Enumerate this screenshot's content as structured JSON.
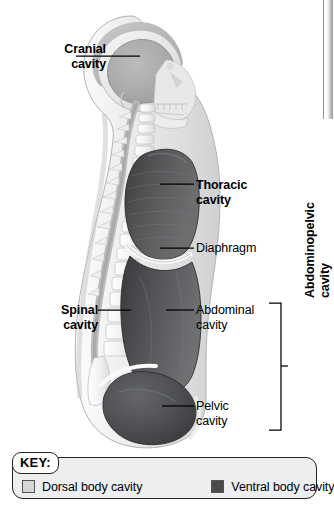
{
  "figure": {
    "labels": {
      "cranial": "Cranial\ncavity",
      "thoracic": "Thoracic\ncavity",
      "diaphragm": "Diaphragm",
      "abdominal": "Abdominal\ncavity",
      "spinal": "Spinal\ncavity",
      "pelvic": "Pelvic\ncavity",
      "abdominopelvic": "Abdominopelvic\ncavity"
    }
  },
  "key": {
    "title": "KEY:",
    "items": [
      {
        "label": "Dorsal body cavity",
        "color": "#d3d5d6"
      },
      {
        "label": "Ventral body cavity",
        "color": "#4a4a4a"
      }
    ]
  },
  "colors": {
    "dorsal_cavity": "#c9cbcc",
    "ventral_cavity": "#4f5052",
    "body_fill": "#e9eaeb",
    "bone": "#f2f3f3",
    "outline": "#9a9c9e",
    "text": "#000000"
  }
}
